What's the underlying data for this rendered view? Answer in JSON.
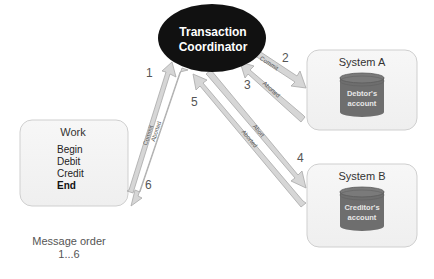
{
  "coordinator": {
    "line1": "Transaction",
    "line2": "Coordinator",
    "fill": "#111111"
  },
  "work": {
    "title": "Work",
    "steps": [
      "Begin",
      "Debit",
      "Credit",
      "End"
    ]
  },
  "system_a": {
    "title": "System A",
    "db_line1": "Debtor's",
    "db_line2": "account"
  },
  "system_b": {
    "title": "System B",
    "db_line1": "Creditor's",
    "db_line2": "account"
  },
  "arrows": [
    {
      "num": "1",
      "label": "Commit"
    },
    {
      "num": "2",
      "label": "Commit"
    },
    {
      "num": "3",
      "label": "Aborted"
    },
    {
      "num": "4",
      "label": "Abort"
    },
    {
      "num": "5",
      "label": "Aborted"
    },
    {
      "num": "6",
      "label": "Aborted"
    }
  ],
  "footer": {
    "line1": "Message order",
    "line2": "1...6"
  },
  "colors": {
    "box_fill": "#f2f2f2",
    "box_stroke": "#cccccc",
    "arrow_fill": "#d6d6d6",
    "arrow_stroke": "#a8a8a8",
    "db_fill": "#6e6e6e"
  }
}
